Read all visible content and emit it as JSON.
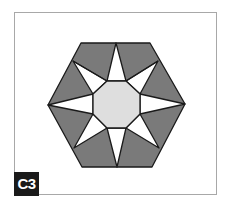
{
  "figure": {
    "label": "C3",
    "colors": {
      "frame_border": "#a8a8a8",
      "dark_fill": "#7a7a7a",
      "star_fill": "#ffffff",
      "center_fill": "#dedede",
      "outline": "#1a1a1a",
      "label_bg": "#1a1a1a",
      "label_text": "#ffffff"
    }
  }
}
